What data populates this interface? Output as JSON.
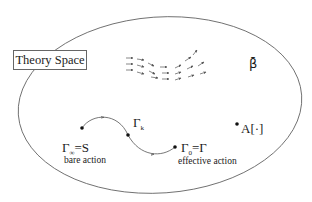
{
  "diagram": {
    "title_box": "Theory Space",
    "beta_label": "β̄",
    "points": [
      {
        "id": "gamma-infinity",
        "label_main": "Γ",
        "label_sub": "∞",
        "label_rest": "=S",
        "caption": "bare action"
      },
      {
        "id": "gamma-k",
        "label_main": "Γ",
        "label_sub": "k",
        "label_rest": "",
        "caption": ""
      },
      {
        "id": "gamma-0",
        "label_main": "Γ",
        "label_sub": "0",
        "label_rest": "=Γ",
        "caption": "effective action"
      },
      {
        "id": "a-functional",
        "label_main": "A[·]",
        "label_sub": "",
        "label_rest": "",
        "caption": ""
      }
    ],
    "colors": {
      "line": "#555555",
      "text": "#1a1a1a",
      "dot": "#111111"
    }
  }
}
